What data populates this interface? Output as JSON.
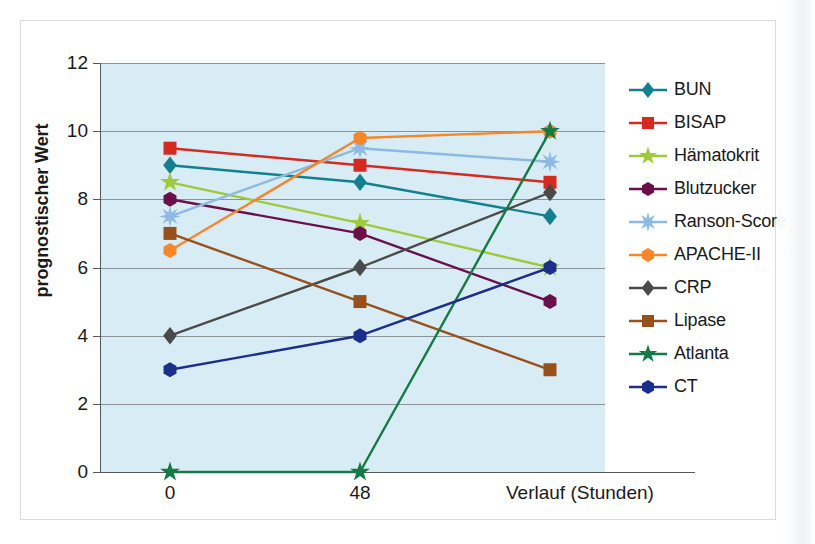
{
  "chart_data": {
    "type": "line",
    "title": "",
    "xlabel": "Verlauf (Stunden)",
    "ylabel": "prognostischer Wert",
    "categories": [
      "0",
      "48",
      ""
    ],
    "x_tick_labels": [
      "0",
      "48"
    ],
    "y_tick_labels": [
      "0",
      "2",
      "4",
      "6",
      "8",
      "10",
      "12"
    ],
    "ylim": [
      0,
      12
    ],
    "y_step": 2,
    "grid": true,
    "legend_position": "right",
    "plot_background": "#d7ecf5",
    "series": [
      {
        "name": "BUN",
        "color": "#13808f",
        "marker": "diamond",
        "values": [
          9.0,
          8.5,
          7.5
        ]
      },
      {
        "name": "BISAP",
        "color": "#d42b20",
        "marker": "square",
        "values": [
          9.5,
          9.0,
          8.5
        ]
      },
      {
        "name": "Hämatokrit",
        "color": "#9dc93b",
        "marker": "star",
        "values": [
          8.5,
          7.3,
          6.0
        ]
      },
      {
        "name": "Blutzucker",
        "color": "#6b0f4b",
        "marker": "hexagon",
        "values": [
          8.0,
          7.0,
          5.0
        ]
      },
      {
        "name": "Ranson-Score",
        "color": "#8db9e2",
        "marker": "burst",
        "values": [
          7.5,
          9.5,
          9.1
        ]
      },
      {
        "name": "APACHE-II",
        "color": "#f5862a",
        "marker": "hexagon",
        "values": [
          6.5,
          9.8,
          10.0
        ]
      },
      {
        "name": "CRP",
        "color": "#4a4a4a",
        "marker": "diamond",
        "values": [
          4.0,
          6.0,
          8.2
        ]
      },
      {
        "name": "Lipase",
        "color": "#97501b",
        "marker": "square",
        "values": [
          7.0,
          5.0,
          3.0
        ]
      },
      {
        "name": "Atlanta",
        "color": "#157a45",
        "marker": "star",
        "values": [
          0.0,
          0.0,
          10.0
        ]
      },
      {
        "name": "CT",
        "color": "#1b2f8a",
        "marker": "hexagon",
        "values": [
          3.0,
          4.0,
          6.0
        ]
      }
    ]
  },
  "legend": {
    "items": [
      {
        "label": "BUN"
      },
      {
        "label": "BISAP"
      },
      {
        "label": "Hämatokrit"
      },
      {
        "label": "Blutzucker"
      },
      {
        "label": "Ranson-Score"
      },
      {
        "label": "APACHE-II"
      },
      {
        "label": "CRP"
      },
      {
        "label": "Lipase"
      },
      {
        "label": "Atlanta"
      },
      {
        "label": "CT"
      }
    ]
  }
}
